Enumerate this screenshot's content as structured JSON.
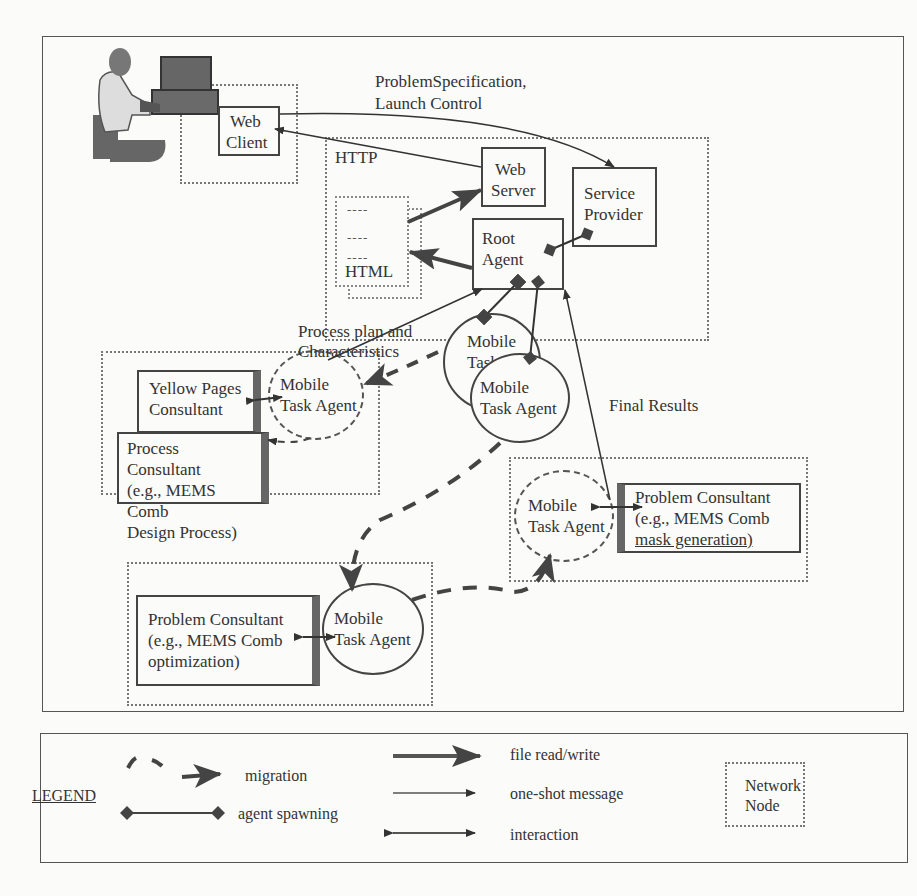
{
  "diagram": {
    "labels": {
      "problem_spec": "ProblemSpecification,",
      "launch_control": "Launch Control",
      "http": "HTTP",
      "process_plan_1": "Process plan and",
      "process_plan_2": "Characteristics",
      "final_results": "Final Results"
    },
    "web_client": {
      "line1": "Web",
      "line2": "Client"
    },
    "web_server": {
      "line1": "Web",
      "line2": "Server"
    },
    "service_provider": {
      "line1": "Service",
      "line2": "Provider"
    },
    "root_agent": {
      "line1": "Root",
      "line2": "Agent"
    },
    "html_doc": {
      "label": "HTML",
      "dashes": [
        "----",
        "----",
        "----"
      ]
    },
    "yellow_pages": {
      "line1": "Yellow Pages",
      "line2": "Consultant"
    },
    "process_consultant": {
      "line1": "Process Consultant",
      "line2": "(e.g., MEMS Comb",
      "line3": "Design Process)"
    },
    "problem_consultant_opt": {
      "line1": "Problem Consultant",
      "line2": "(e.g., MEMS Comb",
      "line3": "optimization)"
    },
    "problem_consultant_mask": {
      "line1": "Problem Consultant",
      "line2": "(e.g., MEMS Comb",
      "line3": "mask generation)"
    },
    "agents": {
      "mta_back": {
        "line1": "Mobile",
        "line2": "Task"
      },
      "mta_front": {
        "line1": "Mobile",
        "line2": "Task Agent"
      },
      "mta_process": {
        "line1": "Mobile",
        "line2": "Task Agent"
      },
      "mta_opt": {
        "line1": "Mobile",
        "line2": "Task Agent"
      },
      "mta_mask": {
        "line1": "Mobile",
        "line2": "Task Agent"
      }
    }
  },
  "legend": {
    "title": "LEGEND",
    "items": {
      "migration": "migration",
      "spawning": "agent spawning",
      "file_rw": "file read/write",
      "oneshot": "one-shot message",
      "interaction": "interaction",
      "node_line1": "Network",
      "node_line2": "Node"
    }
  }
}
